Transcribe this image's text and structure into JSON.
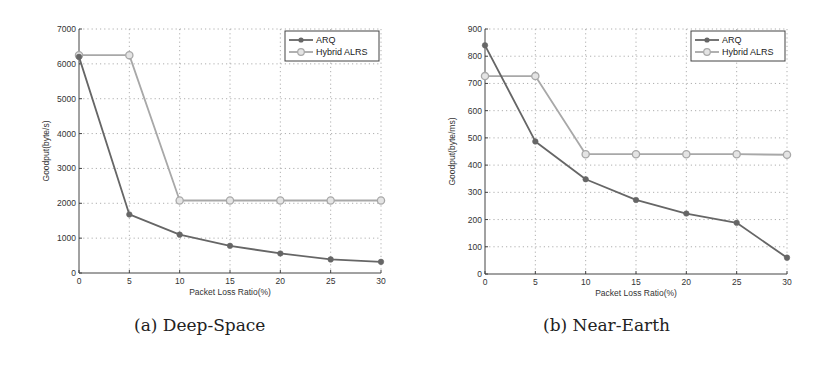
{
  "figures": [
    {
      "caption": "(a) Deep-Space",
      "xlabel": "Packet Loss Ratio(%)",
      "ylabel": "Goodput(byte/s)"
    },
    {
      "caption": "(b) Near-Earth",
      "xlabel": "Packet Loss Ratio(%)",
      "ylabel": "Goodput(byte/ms)"
    }
  ],
  "colors": {
    "arq": "#666666",
    "hybrid": "#a8a8a8"
  },
  "chart_data": [
    {
      "type": "line",
      "title": "(a) Deep-Space",
      "xlabel": "Packet Loss Ratio(%)",
      "ylabel": "Goodput(byte/s)",
      "x": [
        0,
        5,
        10,
        15,
        20,
        25,
        30
      ],
      "xlim": [
        0,
        30
      ],
      "ylim": [
        0,
        7000
      ],
      "xticks": [
        0,
        5,
        10,
        15,
        20,
        25,
        30
      ],
      "yticks": [
        0,
        1000,
        2000,
        3000,
        4000,
        5000,
        6000,
        7000
      ],
      "grid": true,
      "legend_position": "upper right",
      "series": [
        {
          "name": "ARQ",
          "marker": "filled-circle",
          "values": [
            6200,
            1680,
            1100,
            780,
            560,
            390,
            320
          ]
        },
        {
          "name": "Hybrid ALRS",
          "marker": "open-circle",
          "values": [
            6250,
            6250,
            2080,
            2080,
            2080,
            2080,
            2080
          ]
        }
      ]
    },
    {
      "type": "line",
      "title": "(b) Near-Earth",
      "xlabel": "Packet Loss Ratio(%)",
      "ylabel": "Goodput(byte/ms)",
      "x": [
        0,
        5,
        10,
        15,
        20,
        25,
        30
      ],
      "xlim": [
        0,
        30
      ],
      "ylim": [
        0,
        900
      ],
      "xticks": [
        0,
        5,
        10,
        15,
        20,
        25,
        30
      ],
      "yticks": [
        0,
        100,
        200,
        300,
        400,
        500,
        600,
        700,
        800,
        900
      ],
      "grid": true,
      "legend_position": "upper right",
      "series": [
        {
          "name": "ARQ",
          "marker": "filled-circle",
          "values": [
            840,
            487,
            348,
            272,
            222,
            188,
            60
          ]
        },
        {
          "name": "Hybrid ALRS",
          "marker": "open-circle",
          "values": [
            727,
            727,
            440,
            440,
            440,
            440,
            438
          ]
        }
      ]
    }
  ]
}
